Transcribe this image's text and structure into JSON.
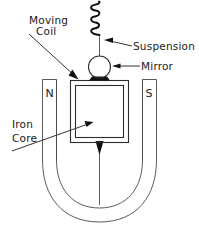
{
  "diagram": {
    "background_color": "#ffffff",
    "ink_color": "#1a1a1a",
    "labels": {
      "moving_coil_line1": "Moving",
      "moving_coil_line2": "Coil",
      "suspension": "Suspension",
      "mirror": "Mirror",
      "iron_core_line1": "Iron",
      "iron_core_line2": "Core",
      "north_pole": "N",
      "south_pole": "S"
    },
    "parts": {
      "suspension_spring": "helical-spring",
      "mirror_bob": "circle-with-dark-base",
      "coil_frame": "double-line-rectangle",
      "magnet": "u-shaped-horseshoe",
      "pointer": "vertical-line-with-arrowhead"
    }
  }
}
